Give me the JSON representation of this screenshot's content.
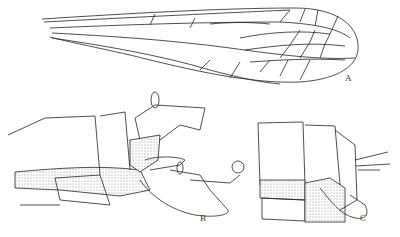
{
  "figure": {
    "panels": [
      {
        "id": "wing",
        "label": "A"
      },
      {
        "id": "genitalia-lateral",
        "label": "B"
      },
      {
        "id": "genitalia-other",
        "label": "C"
      }
    ],
    "colors": {
      "line": "#222222",
      "stipple": "#bbbbbb",
      "background": "#ffffff"
    }
  }
}
